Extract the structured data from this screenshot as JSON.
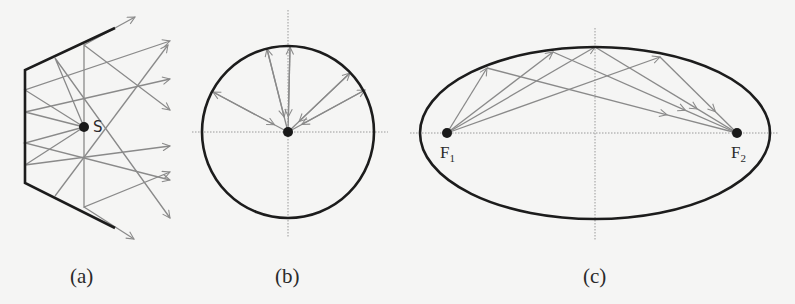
{
  "figure": {
    "panels": [
      {
        "id": "a",
        "caption": "(a)",
        "description": "Polygonal (piecewise flat) reflector; rays from point source S reflect in scattered directions",
        "source_label": "S",
        "source": [
          84,
          127
        ],
        "frame": [
          [
            115,
            28
          ],
          [
            25,
            70
          ],
          [
            25,
            183
          ],
          [
            115,
            228
          ]
        ],
        "rays": [
          {
            "hit": [
              25,
              90
            ],
            "tip": [
              170,
              41
            ]
          },
          {
            "hit": [
              25,
              112
            ],
            "tip": [
              170,
              79
            ]
          },
          {
            "hit": [
              25,
              143
            ],
            "tip": [
              170,
              180
            ]
          },
          {
            "hit": [
              25,
              165
            ],
            "tip": [
              170,
              146
            ]
          },
          {
            "hit": [
              55,
              58
            ],
            "tip": [
              170,
              218
            ]
          },
          {
            "hit": [
              84,
              45
            ],
            "tip": [
              170,
              110
            ]
          },
          {
            "hit": [
              84,
              45
            ],
            "tip": [
              135,
              17
            ],
            "from_source": false
          },
          {
            "hit": [
              84,
              207
            ],
            "tip": [
              134,
              239
            ],
            "from_source": false
          },
          {
            "hit": [
              84,
              207
            ],
            "tip": [
              170,
              172
            ],
            "from_source": true
          },
          {
            "hit": [
              55,
              196
            ],
            "tip": [
              168,
              45
            ],
            "from_source": false
          }
        ]
      },
      {
        "id": "b",
        "caption": "(b)",
        "description": "Circular mirror; rays from the center reflect straight back to the center",
        "center": [
          288,
          132
        ],
        "radius": 86,
        "rays": [
          [
            213,
            92
          ],
          [
            267,
            49
          ],
          [
            290,
            47
          ],
          [
            350,
            73
          ],
          [
            365,
            90
          ]
        ]
      },
      {
        "id": "c",
        "caption": "(c)",
        "description": "Elliptical mirror; rays from focus F1 reflect to focus F2",
        "focus1_label": "F",
        "focus1_sub": "1",
        "focus2_label": "F",
        "focus2_sub": "2",
        "center": [
          595,
          133
        ],
        "rx": 175,
        "ry": 86,
        "focus1": [
          447,
          133
        ],
        "focus2": [
          737,
          133
        ],
        "rays": [
          [
            487,
            68
          ],
          [
            553,
            52
          ],
          [
            595,
            47
          ],
          [
            660,
            57
          ]
        ]
      }
    ]
  }
}
